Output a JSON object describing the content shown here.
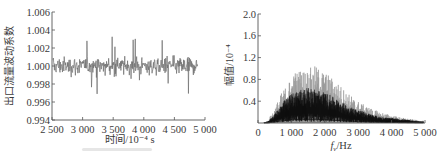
{
  "chart_data": [
    {
      "id": "time-series",
      "type": "line",
      "title": "",
      "xlabel": "时间/10⁻⁴ s",
      "ylabel": "出口流量波动系数",
      "xlim": [
        2500,
        5000
      ],
      "ylim": [
        0.994,
        1.006
      ],
      "x_ticks": [
        2500,
        3000,
        3500,
        4000,
        4500,
        5000
      ],
      "x_tick_labels": [
        "2 500",
        "3 000",
        "3 500",
        "4 000",
        "4 500",
        "5 000"
      ],
      "y_ticks": [
        0.994,
        0.996,
        0.998,
        1.0,
        1.002,
        1.004,
        1.006
      ],
      "y_tick_labels": [
        "0.994",
        "0.996",
        "0.998",
        "1.000",
        "1.002",
        "1.004",
        "1.006"
      ],
      "grid": false,
      "legend": null,
      "series": [
        {
          "name": "出口流量波动系数",
          "color": "#6e6e6e",
          "x_range": [
            2500,
            4880
          ],
          "mean": 1.0,
          "typical_band": [
            0.9985,
            1.0015
          ],
          "extremes": [
            0.9969,
            1.0033
          ],
          "description": "dense noisy signal fluctuating about 1.000"
        }
      ]
    },
    {
      "id": "spectrum",
      "type": "area",
      "title": "",
      "xlabel": "f_v/Hz",
      "ylabel": "幅值/10⁻⁴",
      "xlim": [
        0,
        5000
      ],
      "ylim": [
        0,
        2.0
      ],
      "x_ticks": [
        0,
        1000,
        2000,
        3000,
        4000,
        5000
      ],
      "x_tick_labels": [
        "0",
        "1 000",
        "2 000",
        "3 000",
        "4 000",
        "5 000"
      ],
      "y_ticks": [
        0.4,
        0.8,
        1.2,
        1.6,
        2.0
      ],
      "y_tick_labels": [
        "0.4",
        "0.8",
        "1.2",
        "1.6",
        "2.0"
      ],
      "grid": false,
      "legend": null,
      "series": [
        {
          "name": "幅值",
          "color": "#111111",
          "envelope_x": [
            300,
            500,
            700,
            900,
            1100,
            1300,
            1500,
            1700,
            1900,
            2100,
            2300,
            2500,
            2700,
            2900,
            3100,
            3300,
            3500,
            3700,
            3900,
            4100,
            4300,
            4500,
            4700,
            4900
          ],
          "envelope_peak": [
            0.05,
            0.28,
            0.55,
            0.75,
            0.95,
            1.0,
            1.0,
            1.05,
            1.0,
            0.9,
            0.8,
            0.68,
            0.55,
            0.45,
            0.36,
            0.3,
            0.24,
            0.2,
            0.16,
            0.13,
            0.1,
            0.08,
            0.06,
            0.04
          ],
          "envelope_mean": [
            0.02,
            0.12,
            0.25,
            0.35,
            0.42,
            0.45,
            0.46,
            0.45,
            0.42,
            0.38,
            0.33,
            0.28,
            0.23,
            0.19,
            0.16,
            0.13,
            0.1,
            0.08,
            0.07,
            0.06,
            0.05,
            0.04,
            0.03,
            0.02
          ]
        }
      ]
    }
  ],
  "layout": {
    "left": {
      "x0": 52,
      "x1": 205,
      "y_top": 12,
      "y_bottom": 120
    },
    "right": {
      "x0": 258,
      "x1": 425,
      "y_top": 14,
      "y_bottom": 123
    }
  }
}
